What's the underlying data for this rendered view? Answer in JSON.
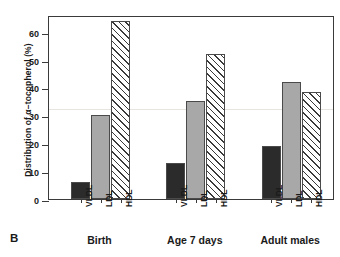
{
  "panel": {
    "letter": "B"
  },
  "chart_data": {
    "type": "bar",
    "title": "",
    "subtitle": "",
    "xlabel": "",
    "ylabel": "Distribution of α−tocopherol (%)",
    "ylim": [
      0,
      66
    ],
    "yticks": [
      0,
      10,
      20,
      30,
      40,
      50,
      60
    ],
    "ytick_labels": [
      "0",
      "10",
      "20",
      "30",
      "40",
      "50",
      "60"
    ],
    "grid": false,
    "legend": "none",
    "groups": [
      "Birth",
      "Age 7 days",
      "Adult males"
    ],
    "categories": [
      "VLDL",
      "LDL",
      "HDL"
    ],
    "series": [
      {
        "name": "VLDL",
        "fill": "solid",
        "values": [
          6,
          13,
          19
        ]
      },
      {
        "name": "LDL",
        "fill": "gray",
        "values": [
          30,
          35,
          42
        ]
      },
      {
        "name": "HDL",
        "fill": "hatch",
        "values": [
          64,
          52,
          38.5
        ]
      }
    ],
    "colors": {
      "vldl": "#2b2b2b",
      "ldl": "#a8a8a8",
      "hdl": "#ffffff",
      "axis": "#3a3a3a",
      "hatch": "#3a3a3a"
    }
  }
}
